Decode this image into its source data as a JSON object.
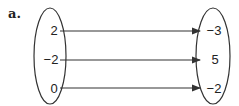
{
  "part_label": "a.",
  "domain": [
    "2",
    "-2",
    "0"
  ],
  "range": [
    "-3",
    "5",
    "-2"
  ],
  "mappings": [
    {
      "from": "2",
      "to": "-3"
    },
    {
      "from": "-2",
      "to": "5"
    },
    {
      "from": "0",
      "to": "-2"
    }
  ],
  "colors": {
    "stroke": "#333333",
    "text": "#222222"
  }
}
